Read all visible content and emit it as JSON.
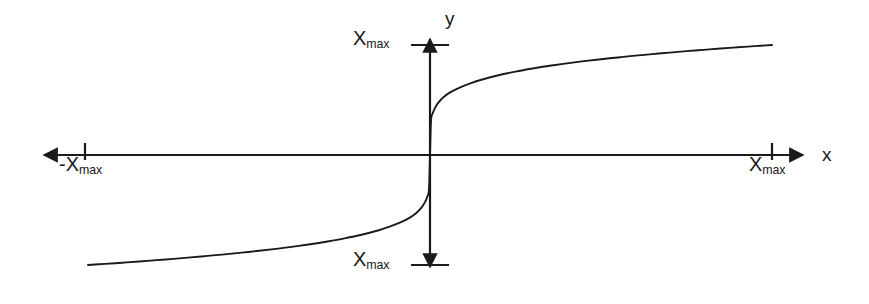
{
  "figure": {
    "background_color": "#ffffff",
    "stroke_color": "#1a1a1a",
    "width": 869,
    "height": 304
  },
  "axes": {
    "x_axis_label": "x",
    "y_axis_label": "y",
    "origin": {
      "x": 430,
      "y": 155
    },
    "x_axis": {
      "start": 35,
      "end": 812
    },
    "y_axis": {
      "start": 30,
      "end": 275
    }
  },
  "ticks": {
    "y_top": {
      "symbol": "X",
      "subscript": "max",
      "pixel_y": 45
    },
    "y_bottom": {
      "symbol": "X",
      "subscript": "max",
      "pixel_y": 265
    },
    "x_left": {
      "symbol": "-X",
      "subscript": "max",
      "pixel_x": 85
    },
    "x_right": {
      "symbol": "X",
      "subscript": "max",
      "pixel_x": 772
    }
  },
  "chart_data": {
    "type": "line",
    "title": "",
    "xlabel": "x",
    "ylabel": "y",
    "xlim": [
      -1,
      1
    ],
    "ylim": [
      -1,
      1
    ],
    "grid": false,
    "legend": null,
    "x_tick_labels": [
      "-X_max",
      "X_max"
    ],
    "x_tick_values": [
      -1,
      1
    ],
    "y_tick_labels": [
      "X_max",
      "X_max"
    ],
    "y_tick_values": [
      1,
      -1
    ],
    "series": [
      {
        "name": "y = sign(x)*|x|^(1/5)",
        "x": [
          -1.0,
          -0.95,
          -0.9,
          -0.85,
          -0.8,
          -0.75,
          -0.7,
          -0.65,
          -0.6,
          -0.55,
          -0.5,
          -0.45,
          -0.4,
          -0.35,
          -0.3,
          -0.25,
          -0.2,
          -0.15,
          -0.12,
          -0.09,
          -0.06,
          -0.04,
          -0.025,
          -0.015,
          -0.008,
          -0.003,
          0.0,
          0.003,
          0.008,
          0.015,
          0.025,
          0.04,
          0.06,
          0.09,
          0.12,
          0.15,
          0.2,
          0.25,
          0.3,
          0.35,
          0.4,
          0.45,
          0.5,
          0.55,
          0.6,
          0.65,
          0.7,
          0.75,
          0.8,
          0.85,
          0.9,
          0.95,
          1.0
        ],
        "y": [
          -1.0,
          -0.99,
          -0.979,
          -0.968,
          -0.956,
          -0.944,
          -0.931,
          -0.917,
          -0.903,
          -0.887,
          -0.871,
          -0.853,
          -0.833,
          -0.811,
          -0.786,
          -0.758,
          -0.725,
          -0.684,
          -0.654,
          -0.618,
          -0.571,
          -0.527,
          -0.478,
          -0.431,
          -0.379,
          -0.313,
          0.0,
          0.313,
          0.379,
          0.431,
          0.478,
          0.527,
          0.571,
          0.618,
          0.654,
          0.684,
          0.725,
          0.758,
          0.786,
          0.811,
          0.833,
          0.853,
          0.871,
          0.887,
          0.903,
          0.917,
          0.931,
          0.944,
          0.956,
          0.968,
          0.979,
          0.99,
          1.0
        ]
      }
    ]
  }
}
